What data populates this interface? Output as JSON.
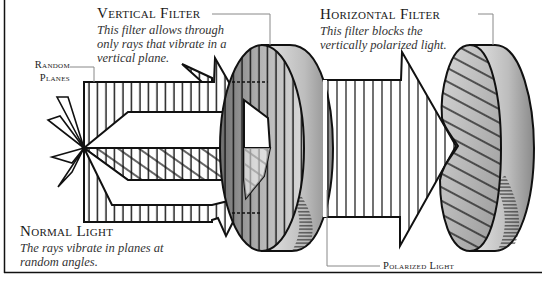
{
  "diagram": {
    "topic": "Light polarization through filters",
    "labels": {
      "vertical_filter": {
        "title": "Vertical Filter",
        "description": [
          "This filter allows through",
          "only rays that vibrate in a",
          "vertical plane."
        ]
      },
      "horizontal_filter": {
        "title": "Horizontal Filter",
        "description": [
          "This filter blocks the",
          "vertically polarized light."
        ]
      },
      "random_planes": {
        "title": [
          "Random",
          "Planes"
        ]
      },
      "normal_light": {
        "title": "Normal Light",
        "description": [
          "The rays vibrate in planes at",
          "random angles."
        ]
      },
      "polarized_light": {
        "title": "Polarized Light"
      }
    },
    "colors": {
      "ink": "#111111",
      "filter_shade_light": "#d9d9d9",
      "filter_shade_dark": "#8c8c8c",
      "leader_line": "#888888",
      "background": "#ffffff"
    }
  }
}
